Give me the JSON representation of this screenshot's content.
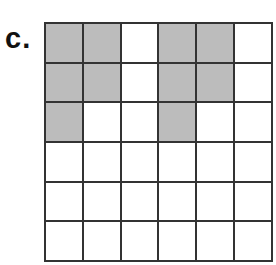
{
  "label": "c.",
  "grid": {
    "rows": 6,
    "cols": 6,
    "shaded": [
      [
        1,
        1,
        0,
        1,
        1,
        0
      ],
      [
        1,
        1,
        0,
        1,
        1,
        0
      ],
      [
        1,
        0,
        0,
        1,
        0,
        0
      ],
      [
        0,
        0,
        0,
        0,
        0,
        0
      ],
      [
        0,
        0,
        0,
        0,
        0,
        0
      ],
      [
        0,
        0,
        0,
        0,
        0,
        0
      ]
    ],
    "shade_color": "#bcbcbc",
    "line_color": "#333333"
  }
}
